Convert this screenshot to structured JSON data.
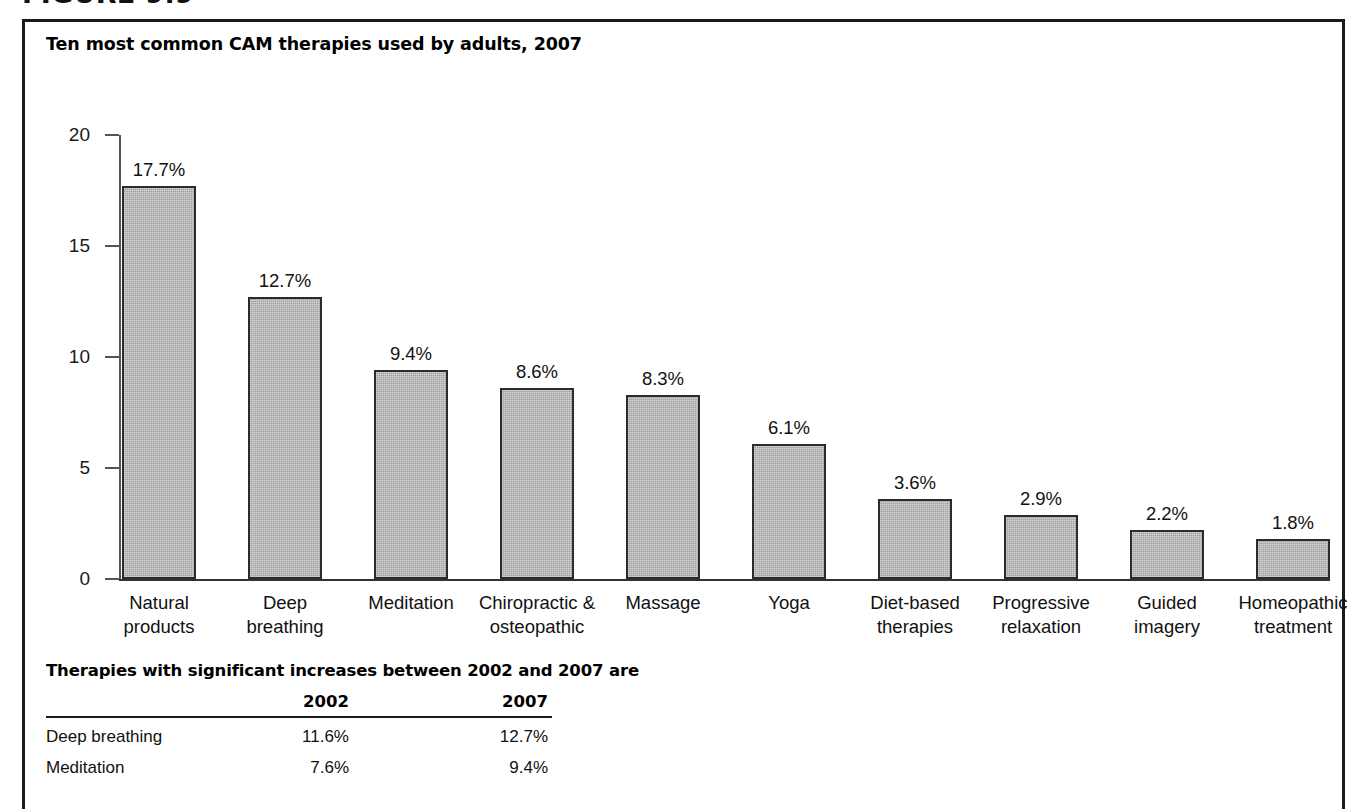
{
  "figure": {
    "number_label": "FIGURE 9.9"
  },
  "chart_title": "Ten most common CAM therapies used by adults, 2007",
  "chart_data": {
    "type": "bar",
    "title": "Ten most common CAM therapies used by adults, 2007",
    "xlabel": "",
    "ylabel": "",
    "ylim": [
      0,
      20
    ],
    "yticks": [
      0,
      5,
      10,
      15,
      20
    ],
    "ytick_labels": [
      "0",
      "5",
      "10",
      "15",
      "20"
    ],
    "grid": false,
    "legend": null,
    "categories": [
      "Natural products",
      "Deep breathing",
      "Meditation",
      "Chiropractic & osteopathic",
      "Massage",
      "Yoga",
      "Diet-based therapies",
      "Progressive relaxation",
      "Guided imagery",
      "Homeopathic treatment"
    ],
    "category_lines": [
      [
        "Natural",
        "products"
      ],
      [
        "Deep",
        "breathing"
      ],
      [
        "Meditation",
        ""
      ],
      [
        "Chiropractic &",
        "osteopathic"
      ],
      [
        "Massage",
        ""
      ],
      [
        "Yoga",
        ""
      ],
      [
        "Diet-based",
        "therapies"
      ],
      [
        "Progressive",
        "relaxation"
      ],
      [
        "Guided",
        "imagery"
      ],
      [
        "Homeopathic",
        "treatment"
      ]
    ],
    "values": [
      17.7,
      12.7,
      9.4,
      8.6,
      8.3,
      6.1,
      3.6,
      2.9,
      2.2,
      1.8
    ],
    "value_labels": [
      "17.7%",
      "12.7%",
      "9.4%",
      "8.6%",
      "8.3%",
      "6.1%",
      "3.6%",
      "2.9%",
      "2.2%",
      "1.8%"
    ],
    "bar_color": "#b3b3b3",
    "bar_edge_color": "#2b2b2b"
  },
  "footnote_table": {
    "heading": "Therapies with significant increases between 2002 and 2007 are",
    "columns": [
      "",
      "2002",
      "2007"
    ],
    "rows": [
      {
        "therapy": "Deep breathing",
        "y2002": "11.6%",
        "y2007": "12.7%"
      },
      {
        "therapy": "Meditation",
        "y2002": "7.6%",
        "y2007": "9.4%"
      }
    ]
  }
}
